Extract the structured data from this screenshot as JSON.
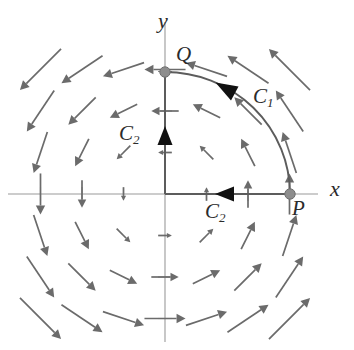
{
  "figure": {
    "background_color": "#ffffff",
    "field_color": "#6b6b6b",
    "curve_color": "#5c5c5c",
    "axis_color": "#9a9a9a",
    "marker_color": "#8d8d8d",
    "label_color": "#2b2b2b"
  },
  "axes": {
    "x_label": "x",
    "y_label": "y",
    "origin_px": [
      165,
      194
    ],
    "unit_px": 41.5,
    "x_ticks": [
      -3,
      -2,
      -1,
      1,
      2,
      3
    ],
    "y_ticks": [
      -3,
      -2,
      -1,
      1,
      2,
      3
    ]
  },
  "labels": {
    "point_p": "P",
    "point_q": "Q",
    "curve_c1": "C",
    "curve_c1_sub": "1",
    "curve_c2_vertical": "C",
    "curve_c2_vertical_sub": "2",
    "curve_c2_horizontal": "C",
    "curve_c2_horizontal_sub": "2"
  },
  "chart_data": {
    "type": "scatter",
    "xlabel": "x",
    "ylabel": "y",
    "xlim": [
      -3.9,
      4.5
    ],
    "ylim": [
      -4.2,
      3.8
    ],
    "grid": false,
    "legend": null,
    "field": {
      "formula": "F(x,y) = (-y, x)",
      "orientation": "counterclockwise",
      "sample_spacing": 1,
      "sample_range": [
        -3,
        3
      ],
      "arrow_scale": 0.33
    },
    "points": [
      {
        "name": "P",
        "x": 3.0,
        "y": 0.0,
        "label": "P",
        "label_offset": [
          0.12,
          -0.42
        ]
      },
      {
        "name": "Q",
        "x": 0.0,
        "y": 3.0,
        "label": "Q",
        "label_offset": [
          0.28,
          0.22
        ]
      }
    ],
    "paths": [
      {
        "name": "C1",
        "kind": "arc",
        "from": "P",
        "to": "Q",
        "center": [
          0,
          0
        ],
        "radius": 3.0,
        "start_angle_deg": 0,
        "end_angle_deg": 90,
        "direction": "counterclockwise",
        "label": "C1",
        "label_at": [
          1.95,
          2.25
        ],
        "arrowhead_at_deg": 60
      },
      {
        "name": "C2",
        "kind": "polyline",
        "from": "P",
        "to": "Q",
        "vertices": [
          [
            3,
            0
          ],
          [
            0,
            0
          ],
          [
            0,
            3
          ]
        ],
        "direction": "P -> origin -> Q",
        "labels": [
          {
            "text": "C2",
            "at": [
              1.3,
              -0.62
            ]
          },
          {
            "text": "C2",
            "at": [
              -0.95,
              1.52
            ]
          }
        ],
        "arrowheads": [
          {
            "at": [
              1.52,
              0
            ],
            "points": "left"
          },
          {
            "at": [
              0,
              1.3
            ],
            "points": "up"
          }
        ]
      }
    ]
  }
}
